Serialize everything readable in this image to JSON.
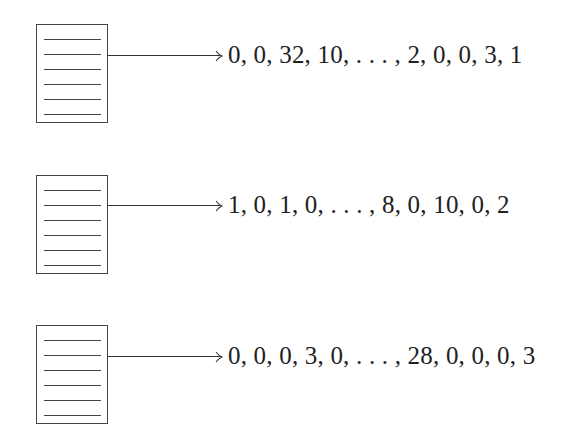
{
  "rows": [
    {
      "document": "document-1",
      "vector": "0, 0, 32, 10, . . . , 2, 0, 0, 3, 1"
    },
    {
      "document": "document-2",
      "vector": "1, 0, 1, 0, . . . , 8, 0, 10, 0, 2"
    },
    {
      "document": "document-3",
      "vector": "0, 0, 0, 3, 0, . . . , 28, 0, 0, 0, 3"
    }
  ],
  "colors": {
    "stroke": "#444444",
    "text": "#222222",
    "background": "#ffffff"
  }
}
